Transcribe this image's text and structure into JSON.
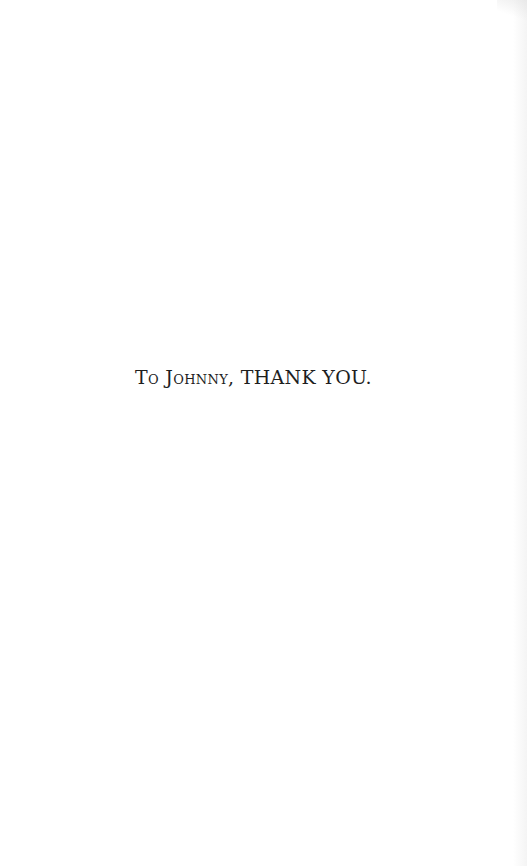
{
  "page": {
    "background": "#ffffff",
    "text_color": "#1e1e1e"
  },
  "dedication": {
    "smallcaps_part": "To Johnny,",
    "caps_part": "THANK YOU."
  }
}
